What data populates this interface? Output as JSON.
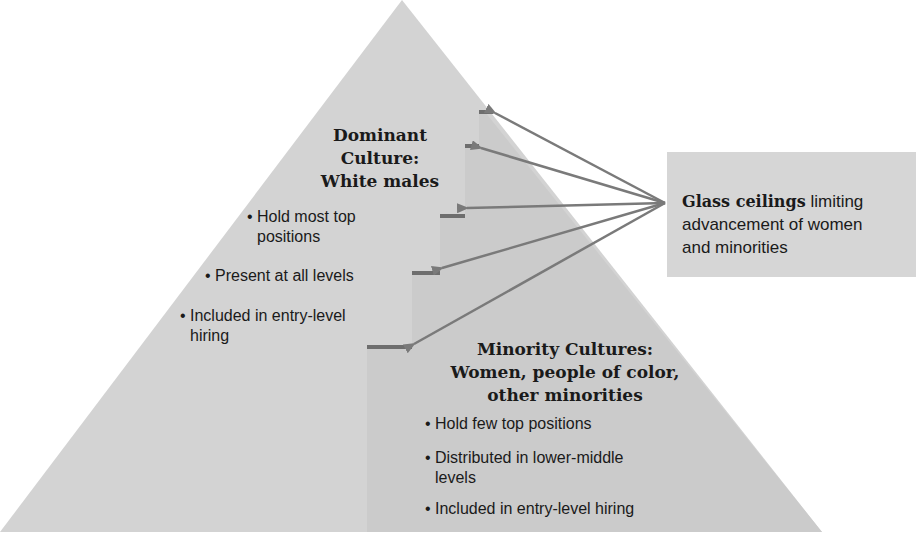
{
  "diagram": {
    "type": "pyramid",
    "colors": {
      "background": "#ffffff",
      "dominant_region": "#d3d3d3",
      "minority_region": "#cbcbcb",
      "callout_box": "#d6d6d6",
      "ceiling_bars": "#6e6e6e",
      "arrows": "#7a7a7a",
      "text": "#1a1a1a"
    },
    "dominant": {
      "title_lines": [
        "Dominant",
        "Culture:",
        "White males"
      ],
      "bullets": [
        "Hold most top positions",
        "Present at all levels",
        "Included in entry-level hiring"
      ],
      "bullet_lines": [
        [
          "Hold most top",
          "positions"
        ],
        [
          "Present at all levels"
        ],
        [
          "Included in entry-level",
          "hiring"
        ]
      ]
    },
    "minority": {
      "title_lines": [
        "Minority Cultures:",
        "Women, people of color,",
        "other minorities"
      ],
      "bullets": [
        "Hold few top positions",
        "Distributed in lower-middle levels",
        "Included in entry-level hiring"
      ],
      "bullet_lines": [
        [
          "Hold few top positions"
        ],
        [
          "Distributed in lower-middle",
          "levels"
        ],
        [
          "Included in entry-level hiring"
        ]
      ]
    },
    "callout": {
      "strong": "Glass ceilings",
      "rest_line1": " limiting",
      "rest_line2": "advancement of women",
      "rest_line3": "and minorities",
      "full_text": "Glass ceilings limiting advancement of women and minorities"
    },
    "bullet_glyph": "•",
    "ceiling_count": 5
  }
}
